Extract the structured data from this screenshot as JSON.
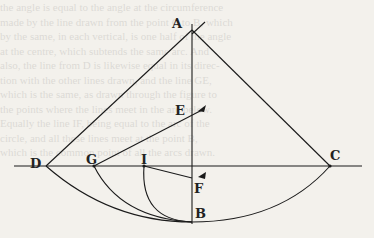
{
  "figure": {
    "type": "geometric-diagram",
    "points": {
      "A": {
        "label": "A",
        "x": 192,
        "y": 28
      },
      "B": {
        "label": "B",
        "x": 192,
        "y": 222
      },
      "C": {
        "label": "C",
        "x": 330,
        "y": 166
      },
      "D": {
        "label": "D",
        "x": 46,
        "y": 166
      },
      "E": {
        "label": "E",
        "x": 192,
        "y": 112
      },
      "F": {
        "label": "F",
        "x": 192,
        "y": 178
      },
      "G": {
        "label": "G",
        "x": 94,
        "y": 166
      },
      "I": {
        "label": "I",
        "x": 144,
        "y": 166
      }
    },
    "segments": [
      "AB",
      "DC",
      "AD",
      "AC",
      "GE",
      "IF"
    ],
    "arcs": [
      "D-B",
      "G-B",
      "I-B",
      "C-B"
    ],
    "labels": {
      "A": "A",
      "B": "B",
      "C": "C",
      "D": "D",
      "E": "E",
      "F": "F",
      "G": "G",
      "I": "I"
    }
  },
  "background_text": "the angle is equal to the angle at the circumference\nmade by the line drawn from the point C to B, which\nby the same, in each vertical, is one half of the angle\nat the centre, which subtends the same arc. And\nalso, the line from D is likewise equal in its direc-\ntion with the other lines drawn, and the line GE,\nwhich is the same, as drawn through the figure to\nthe points where the lines meet in the arc below.\nEqually the line IF, being equal to the arc of the\ncircle, and all these lines meet at the point B,\nwhich is the common point of all the arcs drawn."
}
